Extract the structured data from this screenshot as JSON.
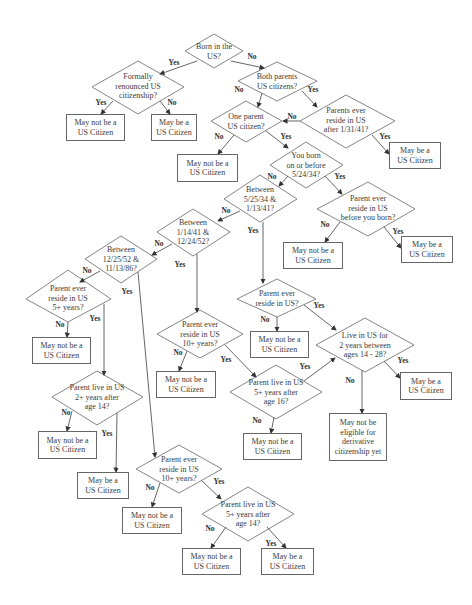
{
  "diagram": {
    "type": "flowchart",
    "decisions": [
      {
        "id": "d1",
        "text": "Born in the\nUS?"
      },
      {
        "id": "d2",
        "text": "Formally\nrenounced US\ncitizenship?"
      },
      {
        "id": "d3",
        "text": "Both parents\nUS citizens?"
      },
      {
        "id": "d4",
        "text": "Parents ever\nreside in US\nafter 1/31/41?"
      },
      {
        "id": "d5",
        "text": "One parent\nUS citizen?"
      },
      {
        "id": "d6",
        "text": "You born\non or before\n5/24/34?"
      },
      {
        "id": "d7",
        "text": "Between\n5/25/34 &\n1/13/41?"
      },
      {
        "id": "d8",
        "text": "Parent ever\nreside in US\nbefore you born?"
      },
      {
        "id": "d9",
        "text": "Between\n1/14/41 &\n12/24/52?"
      },
      {
        "id": "d10",
        "text": "Between\n12/25/52 &\n11/13/86?"
      },
      {
        "id": "d11",
        "text": "Parent ever\nreside in US\n5+ years?"
      },
      {
        "id": "d12",
        "text": "Parent live in US\n2+ years after\nage 14?"
      },
      {
        "id": "d13",
        "text": "Parent ever\nreside in US\n10+ years?"
      },
      {
        "id": "d14",
        "text": "Parent ever\nreside in US?"
      },
      {
        "id": "d15",
        "text": "Parent live in US\n5+ years after\nage 16?"
      },
      {
        "id": "d16",
        "text": "Live in US for\n2 years between\nages 14 - 28?"
      },
      {
        "id": "d17",
        "text": "Parent ever\nreside in US\n10+ years?"
      },
      {
        "id": "d18",
        "text": "Parent live in US\n5+ years after\nage 14?"
      }
    ],
    "outcomes": [
      {
        "id": "b1",
        "text": "May not be a\nUS Citizen"
      },
      {
        "id": "b2",
        "text": "May be a\nUS Citizen"
      },
      {
        "id": "b3",
        "text": "May be a\nUS Citizen"
      },
      {
        "id": "b4",
        "text": "May not be a\nUS Citizen"
      },
      {
        "id": "b5",
        "text": "May not be a\nUS Citizen"
      },
      {
        "id": "b6",
        "text": "May be a\nUS Citizen"
      },
      {
        "id": "b7",
        "text": "May not be a\nUS Citizen"
      },
      {
        "id": "b8",
        "text": "May not be a\nUS Citizen"
      },
      {
        "id": "b9",
        "text": "May be a\nUS Citizen"
      },
      {
        "id": "b10",
        "text": "May not be a\nUS Citizen"
      },
      {
        "id": "b11",
        "text": "May not be a\nUS Citizen"
      },
      {
        "id": "b12",
        "text": "May not be a\nUS Citizen"
      },
      {
        "id": "b13",
        "text": "May be a\nUS Citizen"
      },
      {
        "id": "b14",
        "text": "May not be\neligible for\nderivative\ncitizenship yet"
      },
      {
        "id": "b15",
        "text": "May not be a\nUS Citizen"
      },
      {
        "id": "b16",
        "text": "May not be a\nUS Citizen"
      },
      {
        "id": "b17",
        "text": "May be a\nUS Citizen"
      }
    ],
    "edge_labels": {
      "yes": "Yes",
      "no": "No"
    },
    "edges": [
      {
        "from": "d1",
        "to": "d2",
        "label": "Yes"
      },
      {
        "from": "d1",
        "to": "d3",
        "label": "No"
      },
      {
        "from": "d2",
        "to": "b1",
        "label": "Yes"
      },
      {
        "from": "d2",
        "to": "b2",
        "label": "No"
      },
      {
        "from": "d3",
        "to": "d5",
        "label": "No"
      },
      {
        "from": "d3",
        "to": "d4",
        "label": "Yes"
      },
      {
        "from": "d4",
        "to": "d5",
        "label": "No"
      },
      {
        "from": "d4",
        "to": "b3",
        "label": "Yes"
      },
      {
        "from": "d5",
        "to": "b4",
        "label": "No"
      },
      {
        "from": "d5",
        "to": "d6",
        "label": "Yes"
      },
      {
        "from": "d6",
        "to": "d7",
        "label": "No"
      },
      {
        "from": "d6",
        "to": "d8",
        "label": "Yes"
      },
      {
        "from": "d8",
        "to": "b5",
        "label": "No"
      },
      {
        "from": "d8",
        "to": "b6",
        "label": "Yes"
      },
      {
        "from": "d7",
        "to": "d9",
        "label": "No"
      },
      {
        "from": "d7",
        "to": "d14",
        "label": "Yes"
      },
      {
        "from": "d9",
        "to": "d10",
        "label": "No"
      },
      {
        "from": "d9",
        "to": "d13",
        "label": "Yes"
      },
      {
        "from": "d10",
        "to": "d11",
        "label": "No"
      },
      {
        "from": "d10",
        "to": "d17",
        "label": "Yes"
      },
      {
        "from": "d11",
        "to": "b7",
        "label": "No"
      },
      {
        "from": "d11",
        "to": "d12",
        "label": "Yes"
      },
      {
        "from": "d12",
        "to": "b8",
        "label": "No"
      },
      {
        "from": "d12",
        "to": "b9",
        "label": "Yes"
      },
      {
        "from": "d13",
        "to": "b10",
        "label": "No"
      },
      {
        "from": "d13",
        "to": "d15",
        "label": "Yes"
      },
      {
        "from": "d14",
        "to": "b11",
        "label": "No"
      },
      {
        "from": "d14",
        "to": "d16",
        "label": "Yes"
      },
      {
        "from": "d15",
        "to": "b12",
        "label": "No"
      },
      {
        "from": "d15",
        "to": "d16",
        "label": "Yes"
      },
      {
        "from": "d16",
        "to": "b14",
        "label": "No"
      },
      {
        "from": "d16",
        "to": "b13",
        "label": "Yes"
      },
      {
        "from": "d17",
        "to": "b15",
        "label": "No"
      },
      {
        "from": "d17",
        "to": "d18",
        "label": "Yes"
      },
      {
        "from": "d18",
        "to": "b16",
        "label": "No"
      },
      {
        "from": "d18",
        "to": "b17",
        "label": "Yes"
      }
    ]
  },
  "colors": {
    "line": "#555555",
    "text": "#3a3a3a",
    "background": "#ffffff"
  }
}
